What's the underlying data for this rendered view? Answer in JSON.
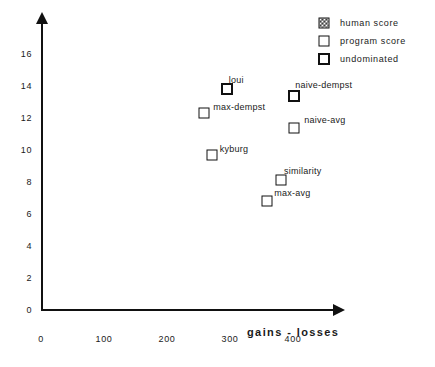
{
  "chart_data": {
    "type": "scatter",
    "title": "",
    "xlabel": "gains - losses",
    "ylabel": "",
    "xlim": [
      0,
      440
    ],
    "ylim": [
      0,
      17.5
    ],
    "grid": false,
    "legend_position": "top-right",
    "xticks": [
      "0",
      "100",
      "200",
      "300",
      "400"
    ],
    "xtick_values": [
      0,
      100,
      200,
      300,
      400
    ],
    "yticks": [
      "0",
      "2",
      "4",
      "6",
      "8",
      "10",
      "12",
      "14",
      "16"
    ],
    "ytick_values": [
      0,
      2,
      4,
      6,
      8,
      10,
      12,
      14,
      16
    ],
    "legend": [
      {
        "label": "human score",
        "marker": "hatched-square"
      },
      {
        "label": "program score",
        "marker": "thin-square"
      },
      {
        "label": "undominated",
        "marker": "thick-square"
      }
    ],
    "points": [
      {
        "label": "loui",
        "x": 295,
        "y": 13.8,
        "marker": "thick-square",
        "label_dx": 2,
        "label_dy": -14
      },
      {
        "label": "max-dempst",
        "x": 259,
        "y": 12.3,
        "marker": "thin-square",
        "label_dx": 9,
        "label_dy": -11
      },
      {
        "label": "naive-dempst",
        "x": 402,
        "y": 13.4,
        "marker": "thick-square",
        "label_dx": 1,
        "label_dy": -16
      },
      {
        "label": "naive-avg",
        "x": 402,
        "y": 11.4,
        "marker": "thin-square",
        "label_dx": 10,
        "label_dy": -13
      },
      {
        "label": "kyburg",
        "x": 271,
        "y": 9.7,
        "marker": "thin-square",
        "label_dx": 8,
        "label_dy": -11
      },
      {
        "label": "similarity",
        "x": 381,
        "y": 8.1,
        "marker": "thin-square",
        "label_dx": 3,
        "label_dy": -14
      },
      {
        "label": "max-avg",
        "x": 359,
        "y": 6.8,
        "marker": "thin-square",
        "label_dx": 7,
        "label_dy": -13
      }
    ]
  }
}
